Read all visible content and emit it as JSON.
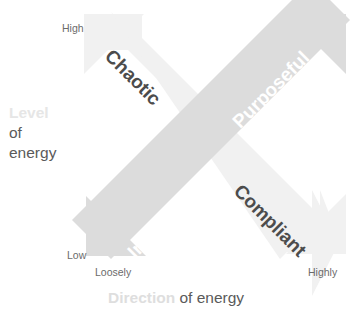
{
  "diagram": {
    "y_axis": {
      "label_faint": "Level",
      "label_solid": "of energy",
      "high_tick": "High",
      "low_tick": "Low"
    },
    "x_axis": {
      "label_faint": "Direction",
      "label_solid": "of energy",
      "low_tick": "Loosely",
      "high_tick": "Highly"
    },
    "quadrants": [
      {
        "name": "chaotic",
        "label": "Chaotic",
        "position": "top-left",
        "text_color": "#4c4c4c",
        "arrow_color": "#f0f0f0"
      },
      {
        "name": "purposeful",
        "label": "Purposeful",
        "position": "top-right",
        "text_color": "#ffffff",
        "arrow_color": "#dcdcdc"
      },
      {
        "name": "compliant",
        "label": "Compliant",
        "position": "bottom-right",
        "text_color": "#4c4c4c",
        "arrow_color": "#f0f0f0"
      },
      {
        "name": "inert",
        "label": "Inert",
        "position": "bottom-left",
        "text_color": "#ffffff",
        "arrow_color": "#dcdcdc"
      }
    ],
    "arrows": [
      {
        "name": "chaotic-compliant-arrow",
        "direction": "top-left to bottom-right",
        "color": "#f0f0f0",
        "double_headed": true
      },
      {
        "name": "inert-purposeful-arrow",
        "direction": "bottom-left to top-right",
        "color": "#dcdcdc",
        "double_headed": true
      }
    ],
    "colors": {
      "background": "#ffffff",
      "arrow_light": "#f0f0f0",
      "arrow_dark": "#dcdcdc",
      "text_dark": "#4c4c4c",
      "text_muted": "#5a5a5a",
      "text_tick": "#6b6b6b",
      "text_faint": "#e2e2e2"
    }
  }
}
